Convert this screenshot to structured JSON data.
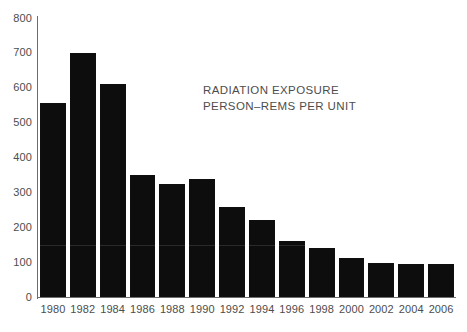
{
  "chart_data": {
    "type": "bar",
    "title": "",
    "annotation_lines": [
      "RADIATION EXPOSURE",
      "PERSON–REMS PER UNIT"
    ],
    "categories": [
      "1980",
      "1982",
      "1984",
      "1986",
      "1988",
      "1990",
      "1992",
      "1994",
      "1996",
      "1998",
      "2000",
      "2002",
      "2004",
      "2006"
    ],
    "values": [
      555,
      700,
      610,
      350,
      325,
      338,
      258,
      220,
      160,
      140,
      112,
      98,
      95,
      95
    ],
    "xlabel": "",
    "ylabel": "",
    "ylim": [
      0,
      800
    ],
    "ytick_labels": [
      "800",
      "700",
      "600",
      "500",
      "400",
      "300",
      "200",
      "100",
      "0"
    ],
    "ytick_values": [
      800,
      700,
      600,
      500,
      400,
      300,
      200,
      100,
      0
    ],
    "grid": false,
    "legend": false,
    "bar_color": "#0d0d0d",
    "axis_color": "#6d6d6d",
    "text_color": "#4d4d4d",
    "background_color": "#ffffff"
  },
  "axes": {
    "y_axis_name": "y-axis",
    "x_axis_name": "x-axis"
  }
}
